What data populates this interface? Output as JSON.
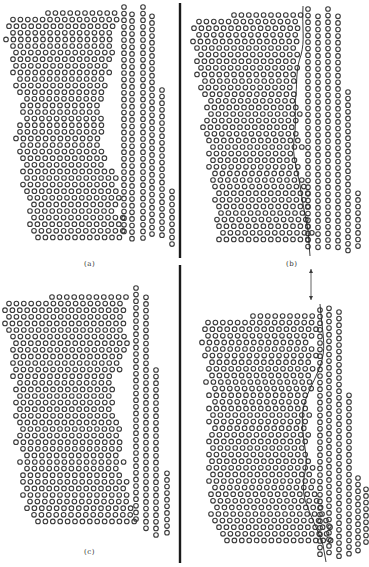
{
  "figure": {
    "background": "#ffffff",
    "ink": "#3a3a3a",
    "divider_color": "#1a1a1a",
    "circle_radius": 2.3,
    "circle_stroke": 1.1,
    "dividers": [
      {
        "x": 180,
        "y1": 3,
        "y2": 258
      },
      {
        "x": 180,
        "y1": 265,
        "y2": 563
      }
    ],
    "arrow": {
      "x": 311,
      "y1": 269,
      "y2": 300
    },
    "panels": [
      {
        "id": "a",
        "label": "(a)",
        "label_x": 84,
        "label_y": 266,
        "left_grain": {
          "row_pitch": 6.6,
          "col_pitch": 7.4,
          "top": 13,
          "rows": [
            [
              48,
              118
            ],
            [
              13,
              118
            ],
            [
              9,
              118
            ],
            [
              13,
              112
            ],
            [
              6,
              112
            ],
            [
              13,
              112
            ],
            [
              16,
              116
            ],
            [
              13,
              112
            ],
            [
              16,
              112
            ],
            [
              13,
              112
            ],
            [
              20,
              108
            ],
            [
              16,
              112
            ],
            [
              20,
              104
            ],
            [
              27,
              104
            ],
            [
              23,
              104
            ],
            [
              23,
              104
            ],
            [
              27,
              104
            ],
            [
              20,
              102
            ],
            [
              20,
              106
            ],
            [
              16,
              102
            ],
            [
              23,
              104
            ],
            [
              20,
              106
            ],
            [
              23,
              108
            ],
            [
              27,
              104
            ],
            [
              23,
              112
            ],
            [
              27,
              116
            ],
            [
              23,
              118
            ],
            [
              27,
              120
            ],
            [
              30,
              122
            ],
            [
              34,
              120
            ],
            [
              30,
              118
            ],
            [
              34,
              124
            ],
            [
              30,
              124
            ],
            [
              34,
              128
            ],
            [
              38,
              126
            ]
          ]
        },
        "right_grain": {
          "columns": [
            {
              "x": 124,
              "top": 7,
              "bottom": 236
            },
            {
              "x": 132,
              "top": 11,
              "bottom": 240
            },
            {
              "x": 143,
              "top": 7,
              "bottom": 240
            },
            {
              "x": 152,
              "top": 13,
              "bottom": 240
            },
            {
              "x": 162,
              "top": 90,
              "bottom": 238
            },
            {
              "x": 172,
              "top": 188,
              "bottom": 250
            }
          ],
          "pitch": 6.6
        }
      },
      {
        "id": "b",
        "label": "(b)",
        "label_x": 286,
        "label_y": 266,
        "boundary_curve": "M 303 6 C 302 30, 305 40, 301 55 C 296 68, 297 80, 296 95 C 294 110, 297 120, 294 140 C 292 155, 297 170, 300 185 C 302 200, 305 215, 308 230 L 310 256",
        "left_grain": {
          "row_pitch": 6.6,
          "col_pitch": 7.4,
          "top": 15,
          "rows": [
            [
              234,
              302
            ],
            [
              199,
              302
            ],
            [
              194,
              302
            ],
            [
              199,
              296
            ],
            [
              193,
              300
            ],
            [
              197,
              296
            ],
            [
              201,
              298
            ],
            [
              197,
              298
            ],
            [
              201,
              298
            ],
            [
              197,
              298
            ],
            [
              205,
              296
            ],
            [
              201,
              296
            ],
            [
              205,
              294
            ],
            [
              211,
              298
            ],
            [
              207,
              298
            ],
            [
              211,
              300
            ],
            [
              207,
              298
            ],
            [
              203,
              298
            ],
            [
              207,
              296
            ],
            [
              209,
              302
            ],
            [
              213,
              302
            ],
            [
              209,
              296
            ],
            [
              213,
              300
            ],
            [
              209,
              300
            ],
            [
              215,
              300
            ],
            [
              213,
              306
            ],
            [
              215,
              304
            ],
            [
              219,
              308
            ],
            [
              215,
              308
            ],
            [
              219,
              308
            ],
            [
              221,
              308
            ],
            [
              217,
              310
            ],
            [
              219,
              310
            ],
            [
              223,
              312
            ],
            [
              219,
              308
            ]
          ]
        },
        "right_grain": {
          "columns": [
            {
              "x": 308,
              "top": 9,
              "bottom": 250
            },
            {
              "x": 318,
              "top": 13,
              "bottom": 250
            },
            {
              "x": 328,
              "top": 9,
              "bottom": 248
            },
            {
              "x": 338,
              "top": 13,
              "bottom": 250
            },
            {
              "x": 348,
              "top": 92,
              "bottom": 252
            },
            {
              "x": 358,
              "top": 190,
              "bottom": 252
            }
          ],
          "pitch": 6.6
        }
      },
      {
        "id": "c",
        "label": "(c)",
        "label_x": 84,
        "label_y": 554,
        "left_grain": {
          "row_pitch": 6.6,
          "col_pitch": 7.4,
          "top": 297,
          "rows": [
            [
              52,
              126
            ],
            [
              9,
              120
            ],
            [
              5,
              124
            ],
            [
              9,
              120
            ],
            [
              5,
              124
            ],
            [
              9,
              124
            ],
            [
              13,
              128
            ],
            [
              16,
              132
            ],
            [
              13,
              128
            ],
            [
              16,
              126
            ],
            [
              13,
              120
            ],
            [
              16,
              120
            ],
            [
              13,
              116
            ],
            [
              20,
              116
            ],
            [
              16,
              114
            ],
            [
              20,
              110
            ],
            [
              16,
              114
            ],
            [
              20,
              112
            ],
            [
              16,
              114
            ],
            [
              20,
              118
            ],
            [
              23,
              122
            ],
            [
              20,
              118
            ],
            [
              16,
              122
            ],
            [
              23,
              120
            ],
            [
              27,
              120
            ],
            [
              20,
              124
            ],
            [
              27,
              120
            ],
            [
              23,
              124
            ],
            [
              23,
              128
            ],
            [
              27,
              126
            ],
            [
              23,
              130
            ],
            [
              30,
              130
            ],
            [
              27,
              134
            ],
            [
              34,
              136
            ],
            [
              38,
              140
            ]
          ]
        },
        "right_grain": {
          "columns": [
            {
              "x": 136,
              "top": 288,
              "bottom": 520
            },
            {
              "x": 146,
              "top": 294,
              "bottom": 530
            },
            {
              "x": 156,
              "top": 370,
              "bottom": 536
            },
            {
              "x": 167,
              "top": 470,
              "bottom": 534
            }
          ],
          "pitch": 6.6
        }
      },
      {
        "id": "d",
        "label": "",
        "label_x": 0,
        "label_y": 0,
        "boundary_curve": "M 320 304 C 322 330, 326 345, 322 360 C 318 375, 308 390, 304 405 C 300 420, 304 440, 306 455 C 308 470, 300 480, 305 500 C 310 515, 318 530, 323 545 L 326 562",
        "left_grain": {
          "row_pitch": 6.6,
          "col_pitch": 7.4,
          "top": 316,
          "rows": [
            [
              253,
              318
            ],
            [
              208,
              318
            ],
            [
              205,
              318
            ],
            [
              208,
              312
            ],
            [
              202,
              312
            ],
            [
              208,
              316
            ],
            [
              205,
              316
            ],
            [
              212,
              314
            ],
            [
              209,
              314
            ],
            [
              212,
              312
            ],
            [
              206,
              312
            ],
            [
              215,
              312
            ],
            [
              209,
              310
            ],
            [
              215,
              308
            ],
            [
              209,
              308
            ],
            [
              213,
              310
            ],
            [
              209,
              306
            ],
            [
              215,
              306
            ],
            [
              212,
              310
            ],
            [
              209,
              308
            ],
            [
              213,
              308
            ],
            [
              209,
              312
            ],
            [
              212,
              314
            ],
            [
              209,
              316
            ],
            [
              213,
              316
            ],
            [
              209,
              316
            ],
            [
              215,
              318
            ],
            [
              211,
              320
            ],
            [
              213,
              322
            ],
            [
              217,
              326
            ],
            [
              211,
              326
            ],
            [
              215,
              328
            ],
            [
              219,
              330
            ],
            [
              223,
              330
            ],
            [
              227,
              332
            ]
          ]
        },
        "right_grain": {
          "columns": [
            {
              "x": 320,
              "top": 310,
              "bottom": 560
            },
            {
              "x": 329,
              "top": 305,
              "bottom": 556
            },
            {
              "x": 339,
              "top": 312,
              "bottom": 560
            },
            {
              "x": 349,
              "top": 392,
              "bottom": 554
            },
            {
              "x": 358,
              "top": 478,
              "bottom": 552
            },
            {
              "x": 366,
              "top": 486,
              "bottom": 548
            }
          ],
          "pitch": 6.6
        }
      }
    ]
  }
}
